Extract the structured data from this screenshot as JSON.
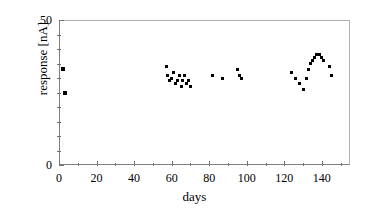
{
  "figure": {
    "background_color": "#ffffff",
    "marker_color": "#000000",
    "axis_color": "#808080"
  },
  "chart_data": {
    "type": "scatter",
    "title": "",
    "xlabel": "days",
    "ylabel": "response [nA]",
    "xlim": [
      0,
      155
    ],
    "ylim": [
      0,
      50
    ],
    "xticks": [
      0,
      20,
      40,
      60,
      80,
      100,
      120,
      140
    ],
    "xtick_labels": [
      "0",
      "20",
      "40",
      "60",
      "80",
      "100",
      "120",
      "140"
    ],
    "xminor_ticks": [
      10,
      30,
      50,
      70,
      90,
      110,
      130,
      150
    ],
    "yticks": [
      0,
      50
    ],
    "ytick_labels": [
      "0",
      "50"
    ],
    "yminor_ticks": [
      5,
      10,
      15,
      20,
      25,
      30,
      35,
      40,
      45
    ],
    "grid": false,
    "legend": null,
    "marker": "square",
    "series": [
      {
        "name": "response",
        "points": [
          [
            2,
            33
          ],
          [
            3,
            25
          ],
          [
            57,
            34
          ],
          [
            58,
            31
          ],
          [
            59,
            29
          ],
          [
            60,
            30
          ],
          [
            61,
            32
          ],
          [
            62,
            28
          ],
          [
            63,
            29
          ],
          [
            64,
            31
          ],
          [
            65,
            27
          ],
          [
            66,
            29
          ],
          [
            67,
            31
          ],
          [
            68,
            28
          ],
          [
            69,
            29
          ],
          [
            70,
            27
          ],
          [
            82,
            31
          ],
          [
            87,
            30
          ],
          [
            95,
            33
          ],
          [
            96,
            31
          ],
          [
            97,
            30
          ],
          [
            124,
            32
          ],
          [
            126,
            30
          ],
          [
            128,
            28
          ],
          [
            130,
            26
          ],
          [
            132,
            30
          ],
          [
            133,
            33
          ],
          [
            134,
            35
          ],
          [
            135,
            36
          ],
          [
            136,
            37
          ],
          [
            137,
            38
          ],
          [
            138,
            38
          ],
          [
            139,
            38
          ],
          [
            140,
            37
          ],
          [
            141,
            36
          ],
          [
            144,
            34
          ],
          [
            145,
            31
          ]
        ]
      }
    ]
  }
}
